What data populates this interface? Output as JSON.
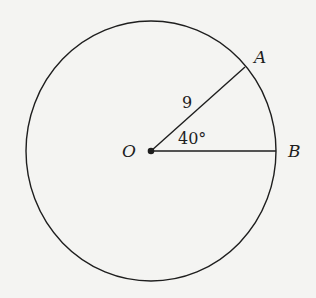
{
  "diagram": {
    "type": "circle-sector",
    "center_label": "O",
    "points": [
      {
        "name": "A",
        "label": "A"
      },
      {
        "name": "B",
        "label": "B"
      }
    ],
    "radius_label": "9",
    "angle_label": "40°",
    "colors": {
      "stroke": "#1e1e1e",
      "background": "#f4f4f2"
    }
  }
}
